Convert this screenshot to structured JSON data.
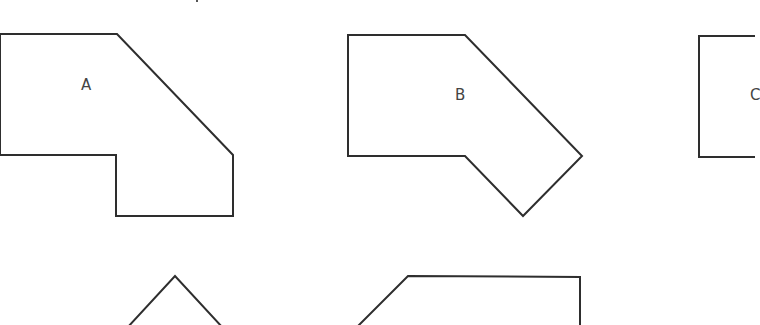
{
  "diagram": {
    "background": "#ffffff",
    "stroke_color": "#2e2e2e",
    "label_color": "#444444",
    "shapes": [
      {
        "id": "A",
        "label": "A",
        "label_pos": [
          88,
          92
        ],
        "points": "0,34 117,34 233,155 233,216 116,216 116,155 0,155"
      },
      {
        "id": "B",
        "label": "B",
        "label_pos": [
          460,
          93
        ],
        "points": "348,35 465,35 582,156 523,216 465,156 348,156"
      },
      {
        "id": "C",
        "label": "C",
        "label_pos": [
          750,
          93
        ],
        "points": "699,36 760,36 760,157 699,157"
      },
      {
        "id": "D",
        "label": "",
        "points": "127,328 175,276 223,328"
      },
      {
        "id": "E",
        "label": "",
        "points": "356,328 408,276 580,277 580,328"
      }
    ]
  }
}
